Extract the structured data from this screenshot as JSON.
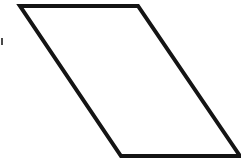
{
  "figure": {
    "title": "Parallelogram",
    "caption": "Outline drawing of a slanted parallelogram",
    "background_color": "#ffffff",
    "stroke_color": "#141414",
    "fill_color": "#ffffff",
    "stroke_width": 4,
    "canvas": {
      "width": 241,
      "height": 160
    },
    "shape": {
      "type": "parallelogram",
      "vertex_labels": [
        "top-left",
        "top-right",
        "bottom-right",
        "bottom-left"
      ],
      "vertices": [
        {
          "name": "top-left",
          "x": 20,
          "y": 6
        },
        {
          "name": "top-right",
          "x": 138,
          "y": 6
        },
        {
          "name": "bottom-right",
          "x": 240,
          "y": 156
        },
        {
          "name": "bottom-left",
          "x": 121,
          "y": 156
        }
      ],
      "points_attr": "20,6 138,6 240,156 121,156",
      "edges": [
        {
          "name": "top-edge",
          "from": "top-left",
          "to": "top-right",
          "orientation": "horizontal"
        },
        {
          "name": "right-edge",
          "from": "top-right",
          "to": "bottom-right",
          "orientation": "diagonal"
        },
        {
          "name": "bottom-edge",
          "from": "bottom-right",
          "to": "bottom-left",
          "orientation": "horizontal"
        },
        {
          "name": "left-edge",
          "from": "bottom-left",
          "to": "top-left",
          "orientation": "diagonal"
        }
      ]
    },
    "artifact": {
      "name": "left-edge-speck",
      "description": "small dark scan speck at the left image border",
      "x": 1,
      "y": 38,
      "width": 2,
      "height": 7,
      "color": "#4a4a4a"
    }
  }
}
